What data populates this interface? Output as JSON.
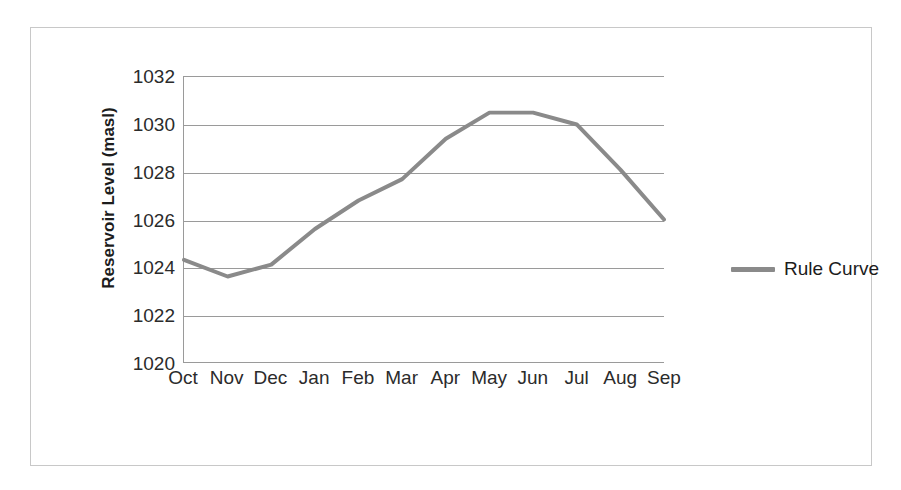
{
  "chart_data": {
    "type": "line",
    "title": "",
    "xlabel": "",
    "ylabel": "Reservoir Level (masl)",
    "categories": [
      "Oct",
      "Nov",
      "Dec",
      "Jan",
      "Feb",
      "Mar",
      "Apr",
      "May",
      "Jun",
      "Jul",
      "Aug",
      "Sep"
    ],
    "series": [
      {
        "name": "Rule Curve",
        "color": "#8a8a8a",
        "values": [
          1024.3,
          1023.6,
          1024.1,
          1025.6,
          1026.8,
          1027.7,
          1029.4,
          1030.5,
          1030.5,
          1030.0,
          1028.1,
          1026.0
        ]
      }
    ],
    "ylim": [
      1020,
      1032
    ],
    "ytick_labels": [
      "1032",
      "1030",
      "1028",
      "1026",
      "1024",
      "1022",
      "1020"
    ],
    "ytick_values": [
      1032,
      1030,
      1028,
      1026,
      1024,
      1022,
      1020
    ],
    "ytick_step": 2,
    "grid": "horizontal",
    "legend_position": "right",
    "legend_entries": [
      "Rule Curve"
    ]
  },
  "legend": {
    "label": "Rule Curve"
  },
  "axis": {
    "y_title": "Reservoir Level (masl)"
  },
  "colors": {
    "series_line": "#8a8a8a",
    "gridline": "#9a9a9a",
    "frame": "#c8c8c8",
    "text": "#2b2b2b",
    "background": "#ffffff"
  }
}
